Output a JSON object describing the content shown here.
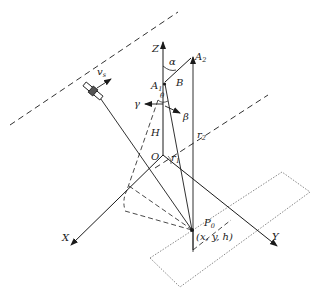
{
  "diagram": {
    "type": "satellite-geometry",
    "labels": {
      "Z": "Z",
      "X": "X",
      "Y": "Y",
      "O": "O",
      "H": "H",
      "alpha": "α",
      "beta": "β",
      "gamma": "γ",
      "B": "B",
      "A1": "A",
      "A1_sub": "1",
      "A2": "A",
      "A2_sub": "2",
      "r1": "r",
      "r1_sub": "1",
      "r2": "r",
      "r2_sub": "2",
      "P0": "P",
      "P0_sub": "0",
      "P0_coords": "(x, y, h)",
      "vs": "v",
      "vs_sub": "s",
      "theta": "θ"
    },
    "colors": {
      "line": "#1a1a1a",
      "background": "#ffffff"
    }
  }
}
